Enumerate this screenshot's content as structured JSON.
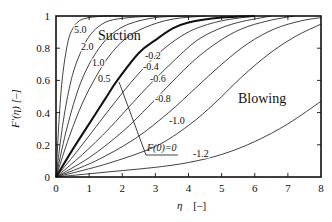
{
  "chart_data": {
    "type": "line",
    "title": "",
    "xlabel": "η [–]",
    "ylabel": "F'(η) [–]",
    "xlim": [
      0,
      8
    ],
    "ylim": [
      0,
      1
    ],
    "xticks": [
      "0",
      "1",
      "2",
      "3",
      "4",
      "5",
      "6",
      "7",
      "8"
    ],
    "yticks": [
      "0",
      "0.2",
      "0.4",
      "0.6",
      "0.8",
      "1"
    ],
    "grid": false,
    "legend": "none (inline curve labels)",
    "annotations": [
      {
        "text": "Suction",
        "x": 2.4,
        "y": 0.88
      },
      {
        "text": "Blowing",
        "x": 5.8,
        "y": 0.55
      },
      {
        "text": "F(0)=0",
        "x": 2.9,
        "y": 0.12,
        "pointer_to": {
          "x": 1.85,
          "y": 0.6
        }
      }
    ],
    "parameter": "F(0)",
    "series": [
      {
        "name": "5.0",
        "x": [
          0,
          0.1,
          0.2,
          0.35,
          0.5,
          0.7,
          1.0,
          1.5,
          2.0
        ],
        "y": [
          0,
          0.38,
          0.63,
          0.83,
          0.92,
          0.97,
          0.99,
          1.0,
          1.0
        ]
      },
      {
        "name": "2.0",
        "x": [
          0,
          0.2,
          0.4,
          0.6,
          0.9,
          1.2,
          1.6,
          2.2,
          3.0
        ],
        "y": [
          0,
          0.32,
          0.55,
          0.7,
          0.84,
          0.92,
          0.97,
          0.99,
          1.0
        ]
      },
      {
        "name": "1.0",
        "x": [
          0,
          0.3,
          0.6,
          0.9,
          1.3,
          1.7,
          2.2,
          3.0,
          4.0
        ],
        "y": [
          0,
          0.28,
          0.5,
          0.66,
          0.8,
          0.89,
          0.95,
          0.99,
          1.0
        ]
      },
      {
        "name": "0.5",
        "x": [
          0,
          0.4,
          0.8,
          1.2,
          1.6,
          2.1,
          2.7,
          3.5,
          4.5
        ],
        "y": [
          0,
          0.25,
          0.46,
          0.62,
          0.75,
          0.86,
          0.93,
          0.98,
          1.0
        ]
      },
      {
        "name": "0",
        "x": [
          0,
          0.5,
          1.0,
          1.5,
          1.85,
          2.5,
          3.0,
          3.5,
          4.0,
          5.0,
          6.0
        ],
        "y": [
          0,
          0.17,
          0.33,
          0.49,
          0.6,
          0.77,
          0.85,
          0.92,
          0.96,
          0.99,
          1.0
        ]
      },
      {
        "name": "-0.2",
        "x": [
          0,
          0.6,
          1.2,
          1.8,
          2.4,
          3.0,
          3.6,
          4.2,
          5.0,
          6.0
        ],
        "y": [
          0,
          0.15,
          0.31,
          0.47,
          0.62,
          0.75,
          0.85,
          0.92,
          0.97,
          1.0
        ]
      },
      {
        "name": "-0.4",
        "x": [
          0,
          0.8,
          1.6,
          2.4,
          3.0,
          3.6,
          4.2,
          4.8,
          5.5,
          6.5
        ],
        "y": [
          0,
          0.14,
          0.3,
          0.48,
          0.61,
          0.73,
          0.84,
          0.91,
          0.96,
          1.0
        ]
      },
      {
        "name": "-0.6",
        "x": [
          0,
          1.0,
          2.0,
          2.8,
          3.5,
          4.2,
          4.9,
          5.6,
          6.4,
          7.2
        ],
        "y": [
          0,
          0.12,
          0.28,
          0.44,
          0.59,
          0.73,
          0.84,
          0.92,
          0.97,
          1.0
        ]
      },
      {
        "name": "-0.8",
        "x": [
          0,
          1.2,
          2.4,
          3.4,
          4.2,
          5.0,
          5.8,
          6.6,
          7.4,
          8.0
        ],
        "y": [
          0,
          0.1,
          0.24,
          0.4,
          0.55,
          0.7,
          0.83,
          0.92,
          0.97,
          0.99
        ]
      },
      {
        "name": "-1.0",
        "x": [
          0,
          1.5,
          3.0,
          4.0,
          4.8,
          5.6,
          6.4,
          7.2,
          8.0
        ],
        "y": [
          0,
          0.08,
          0.19,
          0.32,
          0.46,
          0.62,
          0.76,
          0.87,
          0.95
        ]
      },
      {
        "name": "-1.2",
        "x": [
          0,
          1.0,
          2.0,
          3.0,
          4.0,
          5.0,
          6.0,
          7.0,
          8.0
        ],
        "y": [
          0,
          0.02,
          0.04,
          0.06,
          0.09,
          0.14,
          0.22,
          0.33,
          0.47
        ]
      }
    ],
    "highlighted_series": "0"
  },
  "labels": {
    "suction": "Suction",
    "blowing": "Blowing",
    "f0_annotation": "F(0)=0",
    "xlabel_eta": "η",
    "xlabel_unit": "[–]",
    "ylabel": "F′(η)  [–]"
  }
}
